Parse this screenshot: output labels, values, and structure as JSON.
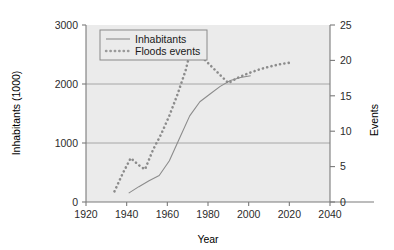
{
  "chart_data": {
    "type": "line",
    "title": "",
    "xlabel": "Year",
    "ylabel": "Inhabitants (1000)",
    "y2label": "Events",
    "xlim": [
      1920,
      2040
    ],
    "ylim": [
      0,
      3000
    ],
    "y2lim": [
      0,
      25
    ],
    "xticks": [
      1920,
      1940,
      1960,
      1980,
      2000,
      2020,
      2040
    ],
    "yticks": [
      0,
      1000,
      2000,
      3000
    ],
    "y2ticks": [
      0,
      5,
      10,
      15,
      20,
      25
    ],
    "grid": "horizontal-gridlines-at-1000-and-2000",
    "legend_position": "top-left-inside",
    "plot_background": "#ebebeb",
    "line_color": "#8c8c8c",
    "series": [
      {
        "name": "Inhabitants",
        "style": "solid",
        "axis": "left",
        "units": "1000 inhabitants",
        "points": [
          [
            1941,
            150
          ],
          [
            1946,
            260
          ],
          [
            1951,
            360
          ],
          [
            1956,
            450
          ],
          [
            1961,
            700
          ],
          [
            1966,
            1080
          ],
          [
            1971,
            1460
          ],
          [
            1976,
            1700
          ],
          [
            1981,
            1830
          ],
          [
            1986,
            1960
          ],
          [
            1991,
            2060
          ],
          [
            1996,
            2110
          ],
          [
            2001,
            2140
          ]
        ]
      },
      {
        "name": "Floods events",
        "style": "dotted",
        "axis": "right",
        "units": "events",
        "points": [
          [
            1934,
            1.5
          ],
          [
            1938,
            4.0
          ],
          [
            1942,
            6.2
          ],
          [
            1946,
            5.2
          ],
          [
            1949,
            4.6
          ],
          [
            1953,
            7.4
          ],
          [
            1957,
            9.6
          ],
          [
            1961,
            12.2
          ],
          [
            1965,
            15.2
          ],
          [
            1969,
            18.6
          ],
          [
            1972,
            22.0
          ],
          [
            1975,
            21.4
          ],
          [
            1978,
            20.2
          ],
          [
            1990,
            16.8
          ],
          [
            1995,
            17.6
          ],
          [
            2000,
            18.2
          ],
          [
            2005,
            18.7
          ],
          [
            2010,
            19.1
          ],
          [
            2016,
            19.5
          ],
          [
            2021,
            19.7
          ]
        ]
      }
    ]
  },
  "legend": {
    "entries": [
      {
        "label": "Inhabitants",
        "style": "solid"
      },
      {
        "label": "Floods events",
        "style": "dotted"
      }
    ]
  },
  "axes": {
    "x": {
      "title": "Year",
      "tick_labels": [
        "1920",
        "1940",
        "1960",
        "1980",
        "2000",
        "2020",
        "2040"
      ]
    },
    "y_left": {
      "title": "Inhabitants (1000)",
      "tick_labels": [
        "0",
        "1000",
        "2000",
        "3000"
      ]
    },
    "y_right": {
      "title": "Events",
      "tick_labels": [
        "0",
        "5",
        "10",
        "15",
        "20",
        "25"
      ]
    }
  },
  "colors": {
    "plot_bg": "#ebebeb",
    "line": "#8c8c8c",
    "axis": "#7a7a7a",
    "gridline": "#a6a6a6",
    "text": "#1a1a1a",
    "legend_border": "#8a8a8a"
  }
}
